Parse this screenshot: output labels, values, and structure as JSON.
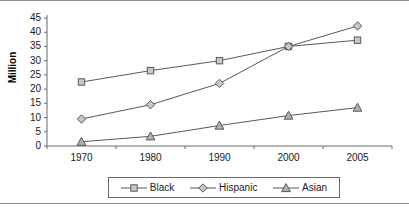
{
  "chart_data": {
    "type": "line",
    "title": "",
    "xlabel": "",
    "ylabel": "Million",
    "categories": [
      "1970",
      "1980",
      "1990",
      "2000",
      "2005"
    ],
    "ylim": [
      0,
      45
    ],
    "yticks": [
      "0",
      "5",
      "10",
      "15",
      "20",
      "25",
      "30",
      "35",
      "40",
      "45"
    ],
    "grid": false,
    "legend_position": "bottom",
    "series": [
      {
        "name": "Black",
        "marker": "square",
        "color": "#595959",
        "fill": "#c8c8c8",
        "values": [
          22.5,
          26.5,
          30.0,
          35.0,
          37.2
        ]
      },
      {
        "name": "Hispanic",
        "marker": "diamond",
        "color": "#595959",
        "fill": "#c8c8c8",
        "values": [
          9.5,
          14.5,
          22.0,
          35.0,
          42.2
        ]
      },
      {
        "name": "Asian",
        "marker": "triangle",
        "color": "#595959",
        "fill": "#b0b0b0",
        "values": [
          1.5,
          3.4,
          7.2,
          10.7,
          13.5
        ]
      }
    ]
  },
  "axis": {
    "y_label": "Million",
    "y_ticks": [
      "45",
      "40",
      "35",
      "30",
      "25",
      "20",
      "15",
      "10",
      "5",
      "0"
    ],
    "x_ticks": [
      "1970",
      "1980",
      "1990",
      "2000",
      "2005"
    ]
  },
  "legend": {
    "entries": [
      {
        "label": "Black",
        "marker": "square-marker-icon"
      },
      {
        "label": "Hispanic",
        "marker": "diamond-marker-icon"
      },
      {
        "label": "Asian",
        "marker": "triangle-marker-icon"
      }
    ]
  }
}
